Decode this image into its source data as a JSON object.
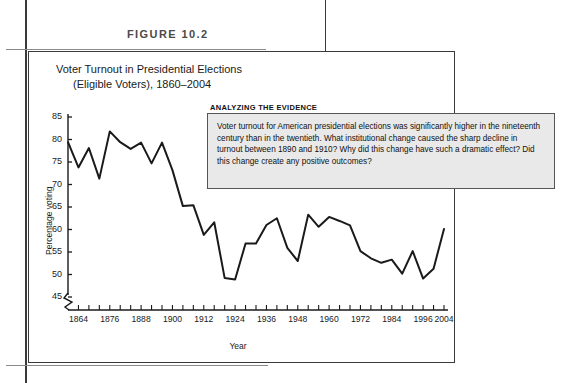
{
  "figure": {
    "label": "FIGURE 10.2",
    "title_line1": "Voter Turnout in Presidential Elections",
    "title_line2": "(Eligible Voters), 1860–2004"
  },
  "callout": {
    "heading": "ANALYZING THE EVIDENCE",
    "body": "Voter turnout for American presidential elections was significantly higher in the nineteenth century than in the twentieth. What institutional change caused the sharp decline in turnout between 1890 and 1910? Why did this change have such a dramatic effect? Did this change create any positive outcomes?"
  },
  "colors": {
    "line": "#1a1a1a",
    "axis": "#1a1a1a",
    "callout_fill": "#e9e9e9",
    "callout_border": "#555555",
    "frame": "#3a3a3a",
    "rule": "#8a8a8a",
    "label_text": "#4a4a4a"
  },
  "chart_data": {
    "type": "line",
    "title": "Voter Turnout in Presidential Elections (Eligible Voters), 1860–2004",
    "xlabel": "Year",
    "ylabel": "Percentage voting",
    "ylim": [
      45,
      85
    ],
    "ytick_values": [
      45,
      50,
      55,
      60,
      65,
      70,
      75,
      80,
      85
    ],
    "xlim": [
      1860,
      2004
    ],
    "xtick_labels": [
      "1864",
      "1876",
      "1888",
      "1900",
      "1912",
      "1924",
      "1936",
      "1948",
      "1960",
      "1972",
      "1984",
      "1996",
      "2004"
    ],
    "xtick_label_values": [
      1864,
      1876,
      1888,
      1900,
      1912,
      1924,
      1936,
      1948,
      1960,
      1972,
      1984,
      1996,
      2004
    ],
    "xtick_interval_years": 4,
    "grid": false,
    "legend": null,
    "y_axis_break": true,
    "x_axis_break": true,
    "x": [
      1860,
      1864,
      1868,
      1872,
      1876,
      1880,
      1884,
      1888,
      1892,
      1896,
      1900,
      1904,
      1908,
      1912,
      1916,
      1920,
      1924,
      1928,
      1932,
      1936,
      1940,
      1944,
      1948,
      1952,
      1956,
      1960,
      1964,
      1968,
      1972,
      1976,
      1980,
      1984,
      1988,
      1992,
      1996,
      2000,
      2004
    ],
    "values": [
      79.4,
      73.8,
      78.1,
      71.3,
      81.8,
      79.4,
      77.9,
      79.3,
      74.7,
      79.3,
      73.2,
      65.2,
      65.4,
      58.8,
      61.6,
      49.2,
      48.9,
      56.9,
      56.9,
      61.0,
      62.5,
      55.9,
      53.0,
      63.3,
      60.6,
      62.8,
      61.9,
      60.9,
      55.2,
      53.6,
      52.6,
      53.3,
      50.2,
      55.2,
      49.1,
      51.3,
      60.1
    ]
  }
}
